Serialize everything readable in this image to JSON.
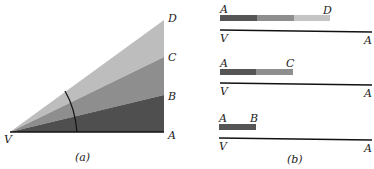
{
  "panel_a": {
    "caption": "(a)",
    "labels": {
      "V": "V",
      "A": "A",
      "B": "B",
      "C": "C",
      "D": "D"
    },
    "colors": {
      "dark": "#4f4f4f",
      "mid": "#8e8e8e",
      "light": "#bdbdbd"
    }
  },
  "panel_b": {
    "caption": "(b)",
    "rows": [
      {
        "start": "A",
        "end": "D",
        "base_left": "V",
        "base_right": "A"
      },
      {
        "start": "A",
        "end": "C",
        "base_left": "V",
        "base_right": "A"
      },
      {
        "start": "A",
        "end": "B",
        "base_left": "V",
        "base_right": "A"
      }
    ]
  }
}
